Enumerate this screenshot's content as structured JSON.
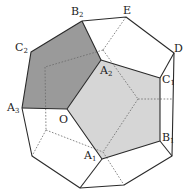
{
  "diagram": {
    "type": "dodecahedron",
    "colors": {
      "dark_face": "#9a9a9a",
      "light_face": "#d6d6d6",
      "edge": "#2a2a2a",
      "hidden_edge": "#6a6a6a"
    },
    "labels": {
      "B2": {
        "base": "B",
        "sub": "2"
      },
      "E": {
        "base": "E",
        "sub": ""
      },
      "D": {
        "base": "D",
        "sub": ""
      },
      "C2": {
        "base": "C",
        "sub": "2"
      },
      "A2": {
        "base": "A",
        "sub": "2"
      },
      "C1": {
        "base": "C",
        "sub": "1"
      },
      "A3": {
        "base": "A",
        "sub": "3"
      },
      "O": {
        "base": "O",
        "sub": ""
      },
      "B1": {
        "base": "B",
        "sub": "1"
      },
      "A1": {
        "base": "A",
        "sub": "1"
      }
    }
  }
}
